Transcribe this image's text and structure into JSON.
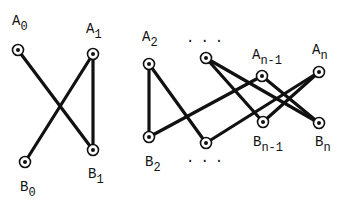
{
  "diagram": {
    "type": "bipartite-graph",
    "colors": {
      "stroke": "#111111",
      "background": "#ffffff"
    },
    "nodes": [
      {
        "id": "A0",
        "base": "A",
        "sub": "0",
        "x": 18,
        "y": 50,
        "lx": 12,
        "ly": 25
      },
      {
        "id": "A1",
        "base": "A",
        "sub": "1",
        "x": 93,
        "y": 54,
        "lx": 86,
        "ly": 33
      },
      {
        "id": "B0",
        "base": "B",
        "sub": "0",
        "x": 25,
        "y": 162,
        "lx": 20,
        "ly": 191
      },
      {
        "id": "B1",
        "base": "B",
        "sub": "1",
        "x": 93,
        "y": 150,
        "lx": 88,
        "ly": 178
      },
      {
        "id": "A2",
        "base": "A",
        "sub": "2",
        "x": 149,
        "y": 64,
        "lx": 142,
        "ly": 41
      },
      {
        "id": "Ak",
        "base": "",
        "sub": "",
        "x": 206,
        "y": 58,
        "lx": 0,
        "ly": 0
      },
      {
        "id": "An-1",
        "base": "A",
        "sub": "n-1",
        "x": 262,
        "y": 76,
        "lx": 252,
        "ly": 59
      },
      {
        "id": "An",
        "base": "A",
        "sub": "n",
        "x": 319,
        "y": 72,
        "lx": 312,
        "ly": 54
      },
      {
        "id": "B2",
        "base": "B",
        "sub": "2",
        "x": 149,
        "y": 137,
        "lx": 145,
        "ly": 166
      },
      {
        "id": "Bk",
        "base": "",
        "sub": "",
        "x": 206,
        "y": 143,
        "lx": 0,
        "ly": 0
      },
      {
        "id": "Bn-1",
        "base": "B",
        "sub": "n-1",
        "x": 263,
        "y": 122,
        "lx": 253,
        "ly": 146
      },
      {
        "id": "Bn",
        "base": "B",
        "sub": "n",
        "x": 319,
        "y": 123,
        "lx": 315,
        "ly": 146
      }
    ],
    "edges": [
      [
        "A0",
        "B1"
      ],
      [
        "A1",
        "B0"
      ],
      [
        "A1",
        "B1"
      ],
      [
        "A2",
        "B2"
      ],
      [
        "A2",
        "Bk"
      ],
      [
        "B2",
        "An-1"
      ],
      [
        "Ak",
        "Bn-1"
      ],
      [
        "Ak",
        "Bn"
      ],
      [
        "Bk",
        "An"
      ],
      [
        "An-1",
        "Bn"
      ],
      [
        "Bn-1",
        "An"
      ]
    ],
    "ellipses": [
      {
        "text": "...",
        "x": 186,
        "y": 42
      },
      {
        "text": "...",
        "x": 186,
        "y": 162
      }
    ]
  }
}
